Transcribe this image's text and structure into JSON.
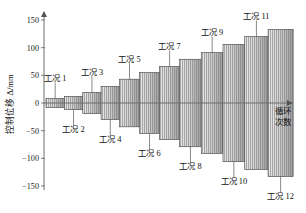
{
  "chart_data": {
    "type": "bar",
    "title": "",
    "subtitle": "",
    "ylabel": "控制位移 Δ/mm",
    "xlabel": "循环次数",
    "xlabel_line1": "循环",
    "xlabel_line2": "次数",
    "ylim": [
      -150,
      150
    ],
    "yticks": [
      150,
      100,
      50,
      0,
      -50,
      -100,
      -150
    ],
    "ytick_labels": [
      "150",
      "100",
      "50",
      "0",
      "−50",
      "−100",
      "−150"
    ],
    "xticks": [],
    "grid": false,
    "legend": null,
    "axis_arrow_x": true,
    "axis_arrow_y": true,
    "categories": [
      "工况 1",
      "工况 2",
      "工况 3",
      "工况 4",
      "工况 5",
      "工况 6",
      "工况 7",
      "工况 8",
      "工况 9",
      "工况 10",
      "工况 11",
      "工况 12"
    ],
    "series": [
      {
        "name": "正向峰值位移",
        "values": [
          8,
          12,
          19,
          30,
          43,
          55,
          66,
          79,
          91,
          106,
          120,
          133
        ]
      },
      {
        "name": "负向峰值位移",
        "values": [
          -8,
          -12,
          -19,
          -30,
          -43,
          -55,
          -66,
          -79,
          -91,
          -106,
          -120,
          -133
        ]
      }
    ],
    "groups": [
      {
        "label": "工况 1",
        "amplitude": 8,
        "cycles": 3,
        "x_start": 0,
        "x_end": 22,
        "label_side": "top"
      },
      {
        "label": "工况 2",
        "amplitude": 12,
        "cycles": 3,
        "x_start": 22,
        "x_end": 44,
        "label_side": "bottom"
      },
      {
        "label": "工况 3",
        "amplitude": 19,
        "cycles": 3,
        "x_start": 44,
        "x_end": 66,
        "label_side": "top"
      },
      {
        "label": "工况 4",
        "amplitude": 30,
        "cycles": 3,
        "x_start": 66,
        "x_end": 88,
        "label_side": "bottom"
      },
      {
        "label": "工况 5",
        "amplitude": 43,
        "cycles": 3,
        "x_start": 88,
        "x_end": 112,
        "label_side": "top"
      },
      {
        "label": "工况 6",
        "amplitude": 55,
        "cycles": 3,
        "x_start": 112,
        "x_end": 136,
        "label_side": "bottom"
      },
      {
        "label": "工况 7",
        "amplitude": 66,
        "cycles": 3,
        "x_start": 136,
        "x_end": 160,
        "label_side": "top"
      },
      {
        "label": "工况 8",
        "amplitude": 79,
        "cycles": 3,
        "x_start": 160,
        "x_end": 186,
        "label_side": "bottom"
      },
      {
        "label": "工况 9",
        "amplitude": 91,
        "cycles": 3,
        "x_start": 186,
        "x_end": 212,
        "label_side": "top"
      },
      {
        "label": "工况 10",
        "amplitude": 106,
        "cycles": 3,
        "x_start": 212,
        "x_end": 238,
        "label_side": "bottom"
      },
      {
        "label": "工况 11",
        "amplitude": 120,
        "cycles": 3,
        "x_start": 238,
        "x_end": 266,
        "label_side": "top"
      },
      {
        "label": "工况 12",
        "amplitude": 133,
        "cycles": 3,
        "x_start": 266,
        "x_end": 296,
        "label_side": "bottom"
      }
    ],
    "colors": {
      "bar_fill_light": "#efefef",
      "bar_fill_dark": "#9e9e9e",
      "bar_stroke": "#555555",
      "hatch": "#8c8c8c",
      "axis": "#6f6f6f",
      "text": "#1a1a1a"
    }
  },
  "labels": {
    "y_axis_title": "控制位移 Δ/mm",
    "x_axis_title_line1": "循环",
    "x_axis_title_line2": "次数",
    "cond_1": "工况 1",
    "cond_2": "工况 2",
    "cond_3": "工况 3",
    "cond_4": "工况 4",
    "cond_5": "工况 5",
    "cond_6": "工况 6",
    "cond_7": "工况 7",
    "cond_8": "工况 8",
    "cond_9": "工况 9",
    "cond_10": "工况 10",
    "cond_11": "工况 11",
    "cond_12": "工况 12",
    "tick_150": "150",
    "tick_100": "100",
    "tick_50": "50",
    "tick_0": "0",
    "tick_n50": "−50",
    "tick_n100": "−100",
    "tick_n150": "−150"
  }
}
